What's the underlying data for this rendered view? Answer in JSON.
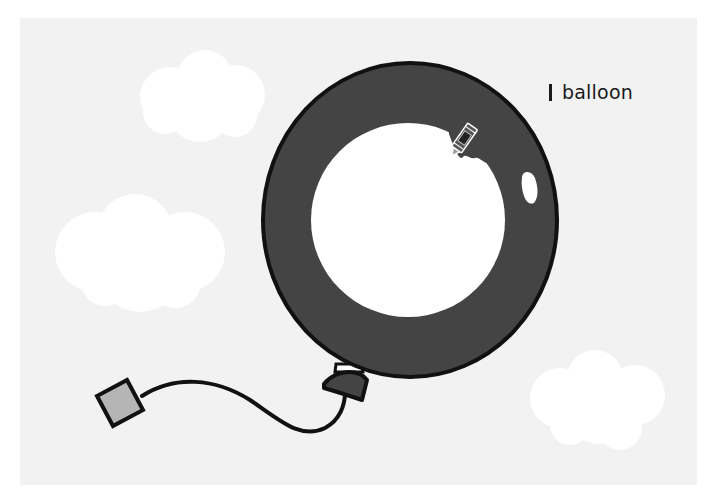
{
  "scene": {
    "label_text": "balloon",
    "colors": {
      "background": "#ffffff",
      "stage": "#f2f2f2",
      "cloud": "#ffffff",
      "balloon_fill": "#444444",
      "balloon_outline": "#111111",
      "uncolored_area": "#ffffff",
      "highlight": "#ffffff",
      "tag_fill": "#b5b5b5",
      "string": "#111111"
    },
    "balloon": {
      "cx": 410,
      "cy": 220,
      "rx": 147,
      "ry": 157
    },
    "uncolored_region": {
      "cx": 408,
      "cy": 220,
      "r": 97
    },
    "crayon_tool": {
      "tip_x": 452,
      "tip_y": 156,
      "state": "coloring"
    },
    "clouds": [
      {
        "id": "cloud-top-left",
        "cx": 198,
        "cy": 97
      },
      {
        "id": "cloud-mid-left",
        "cx": 140,
        "cy": 254
      },
      {
        "id": "cloud-bottom-right",
        "cx": 600,
        "cy": 400
      }
    ]
  }
}
